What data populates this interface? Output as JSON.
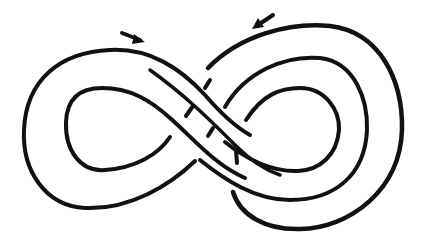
{
  "diagram": {
    "stroke_color": "#111111",
    "background_color": "#ffffff",
    "arrows": [
      {
        "name": "left-arrow",
        "direction": "right-down",
        "position": [
          130,
          37
        ]
      },
      {
        "name": "right-arrow",
        "direction": "left-down",
        "position": [
          263,
          20
        ]
      }
    ]
  }
}
